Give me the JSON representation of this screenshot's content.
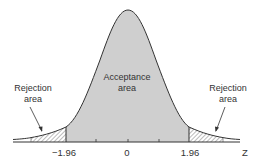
{
  "diagram": {
    "type": "normal-distribution-two-tailed",
    "labels": {
      "acceptance_line1": "Acceptance",
      "acceptance_line2": "area",
      "rejection_left_line1": "Rejection",
      "rejection_left_line2": "area",
      "rejection_right_line1": "Rejection",
      "rejection_right_line2": "area"
    },
    "axis": {
      "label": "Z",
      "ticks": [
        "−1.96",
        "0",
        "1.96"
      ],
      "critical_values": [
        -1.96,
        1.96
      ]
    },
    "colors": {
      "curve": "#333333",
      "acceptance_fill": "#cfcfcf",
      "hatch": "#555555",
      "axis": "#333333",
      "text": "#333333"
    }
  }
}
